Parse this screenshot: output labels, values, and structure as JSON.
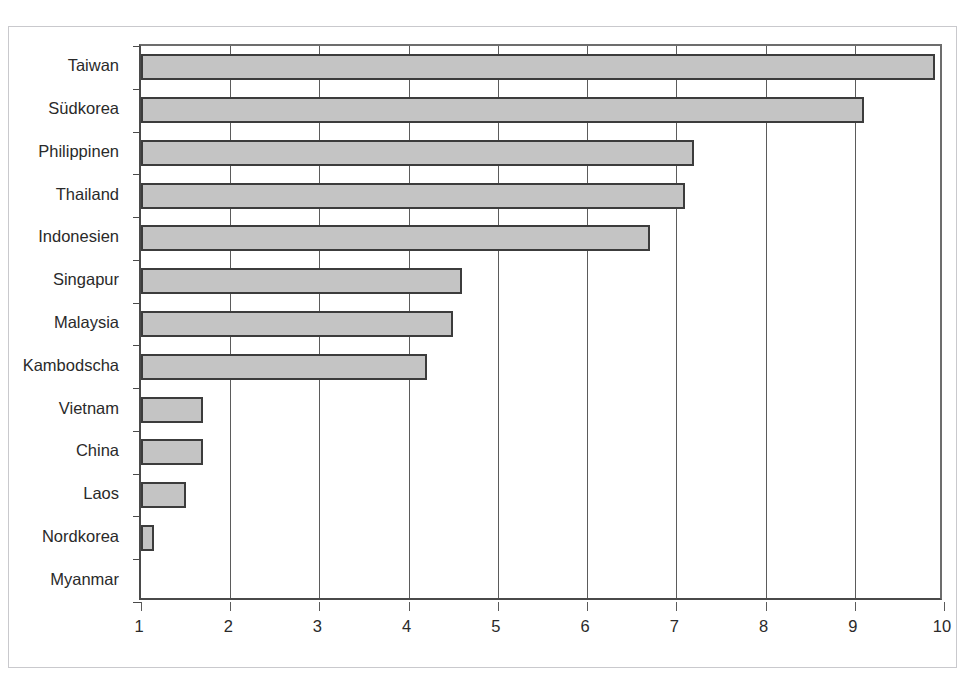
{
  "chart_data": {
    "type": "bar",
    "orientation": "horizontal",
    "title": "",
    "xlabel": "",
    "ylabel": "",
    "xlim": [
      1,
      10
    ],
    "xticks": [
      1,
      2,
      3,
      4,
      5,
      6,
      7,
      8,
      9,
      10
    ],
    "grid": true,
    "legend": "none",
    "categories": [
      "Taiwan",
      "Südkorea",
      "Philippinen",
      "Thailand",
      "Indonesien",
      "Singapur",
      "Malaysia",
      "Kambodscha",
      "Vietnam",
      "China",
      "Laos",
      "Nordkorea",
      "Myanmar"
    ],
    "values": [
      9.9,
      9.1,
      7.2,
      7.1,
      6.7,
      4.6,
      4.5,
      4.2,
      1.7,
      1.7,
      1.5,
      1.15,
      1.0
    ],
    "bar_fill_color": "#c4c4c4",
    "bar_border_color": "#3c3c3c",
    "axis_color": "#4a4a4a",
    "gridline_color": "#5b5b5b",
    "frame_color": "#c9c9cd",
    "text_color": "#2a2a2a"
  },
  "xtick_labels": [
    "1",
    "2",
    "3",
    "4",
    "5",
    "6",
    "7",
    "8",
    "9",
    "10"
  ],
  "clipped_title": ""
}
